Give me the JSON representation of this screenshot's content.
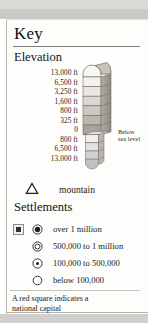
{
  "panel": {
    "title": "Key"
  },
  "elevation": {
    "heading": "Elevation",
    "labels": [
      "13,000 ft",
      "6,500 ft",
      "3,250 ft",
      "1,600 ft",
      "800 ft",
      "325 ft",
      "0",
      "800 ft",
      "6,500 ft",
      "13,000 ft"
    ],
    "below_sea_level_note_line1": "Below",
    "below_sea_level_note_line2": "sea level",
    "above_band_colors": [
      "#f4f2ee",
      "#e9e6e0",
      "#dcd8d1",
      "#cdc9c1",
      "#bcb7ae",
      "#a9a49b",
      "#96918a"
    ],
    "below_band_colors": [
      "#efeeec",
      "#e2e1df",
      "#d2d1cf",
      "#c1c0be"
    ]
  },
  "mountain": {
    "symbol_name": "triangle-outline",
    "label": "mountain"
  },
  "settlements": {
    "heading": "Settlements",
    "capital_marker_name": "red-square",
    "items": [
      {
        "symbol": "filled-dot-in-ring",
        "label": "over 1 million",
        "has_capital_square": true
      },
      {
        "symbol": "double-ring",
        "label": "500,000 to 1 million",
        "has_capital_square": false
      },
      {
        "symbol": "small-dot-in-ring",
        "label": "100,000 to 500,000",
        "has_capital_square": false
      },
      {
        "symbol": "empty-ring",
        "label": "below 100,000",
        "has_capital_square": false
      }
    ]
  },
  "footnote": {
    "line1": "A red square indicates a",
    "line2": "national capital"
  }
}
